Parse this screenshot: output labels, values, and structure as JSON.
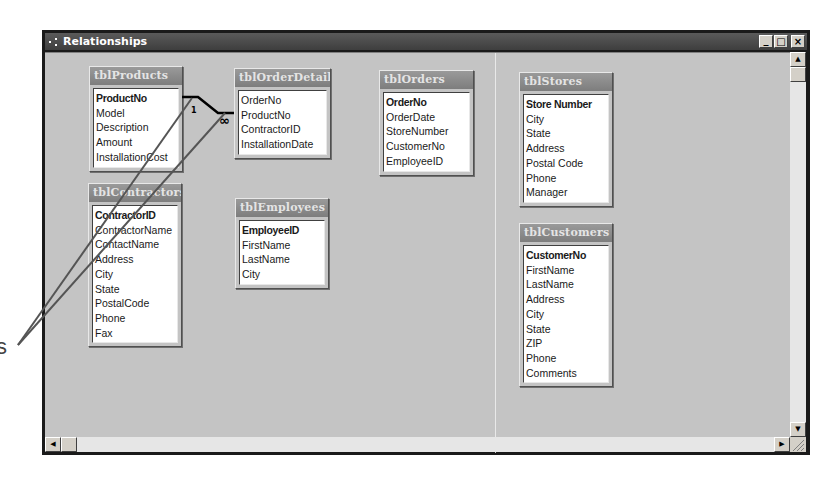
{
  "window": {
    "title": "Relationships",
    "buttons": {
      "minimize": "_",
      "maximize": "□",
      "close": "×"
    }
  },
  "tables": [
    {
      "id": "tblProducts",
      "title": "tblProducts",
      "fields": [
        {
          "name": "ProductNo",
          "primary_key": true
        },
        {
          "name": "Model",
          "primary_key": false
        },
        {
          "name": "Description",
          "primary_key": false
        },
        {
          "name": "Amount",
          "primary_key": false
        },
        {
          "name": "InstallationCost",
          "primary_key": false
        }
      ]
    },
    {
      "id": "tblOrderDetails",
      "title": "tblOrderDetails",
      "fields": [
        {
          "name": "OrderNo",
          "primary_key": false
        },
        {
          "name": "ProductNo",
          "primary_key": false
        },
        {
          "name": "ContractorID",
          "primary_key": false
        },
        {
          "name": "InstallationDate",
          "primary_key": false
        }
      ]
    },
    {
      "id": "tblOrders",
      "title": "tblOrders",
      "fields": [
        {
          "name": "OrderNo",
          "primary_key": true
        },
        {
          "name": "OrderDate",
          "primary_key": false
        },
        {
          "name": "StoreNumber",
          "primary_key": false
        },
        {
          "name": "CustomerNo",
          "primary_key": false
        },
        {
          "name": "EmployeeID",
          "primary_key": false
        }
      ]
    },
    {
      "id": "tblStores",
      "title": "tblStores",
      "fields": [
        {
          "name": "Store Number",
          "primary_key": true
        },
        {
          "name": "City",
          "primary_key": false
        },
        {
          "name": "State",
          "primary_key": false
        },
        {
          "name": "Address",
          "primary_key": false
        },
        {
          "name": "Postal Code",
          "primary_key": false
        },
        {
          "name": "Phone",
          "primary_key": false
        },
        {
          "name": "Manager",
          "primary_key": false
        }
      ]
    },
    {
      "id": "tblContractors",
      "title": "tblContractors",
      "fields": [
        {
          "name": "ContractorID",
          "primary_key": true
        },
        {
          "name": "ContractorName",
          "primary_key": false
        },
        {
          "name": "ContactName",
          "primary_key": false
        },
        {
          "name": "Address",
          "primary_key": false
        },
        {
          "name": "City",
          "primary_key": false
        },
        {
          "name": "State",
          "primary_key": false
        },
        {
          "name": "PostalCode",
          "primary_key": false
        },
        {
          "name": "Phone",
          "primary_key": false
        },
        {
          "name": "Fax",
          "primary_key": false
        }
      ]
    },
    {
      "id": "tblEmployees",
      "title": "tblEmployees",
      "fields": [
        {
          "name": "EmployeeID",
          "primary_key": true
        },
        {
          "name": "FirstName",
          "primary_key": false
        },
        {
          "name": "LastName",
          "primary_key": false
        },
        {
          "name": "City",
          "primary_key": false
        }
      ]
    },
    {
      "id": "tblCustomers",
      "title": "tblCustomers",
      "fields": [
        {
          "name": "CustomerNo",
          "primary_key": true
        },
        {
          "name": "FirstName",
          "primary_key": false
        },
        {
          "name": "LastName",
          "primary_key": false
        },
        {
          "name": "Address",
          "primary_key": false
        },
        {
          "name": "City",
          "primary_key": false
        },
        {
          "name": "State",
          "primary_key": false
        },
        {
          "name": "ZIP",
          "primary_key": false
        },
        {
          "name": "Phone",
          "primary_key": false
        },
        {
          "name": "Comments",
          "primary_key": false
        }
      ]
    }
  ],
  "relationship": {
    "from_table": "tblProducts",
    "from_field": "ProductNo",
    "to_table": "tblOrderDetails",
    "to_field": "ProductNo",
    "one_label": "1",
    "many_label": "∞"
  },
  "callout": {
    "label": "s"
  },
  "scrollbars": {
    "up_arrow": "▲",
    "down_arrow": "▼",
    "left_arrow": "◀",
    "right_arrow": "▶"
  }
}
